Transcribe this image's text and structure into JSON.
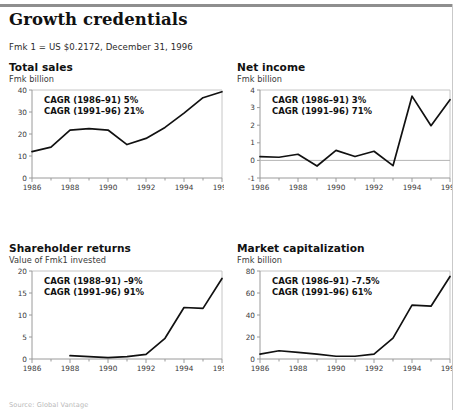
{
  "header": {
    "title": "Growth credentials",
    "subtitle": "Fmk 1 = US $0.2172, December 31, 1996"
  },
  "source_note": "Source: Global Vantage",
  "charts": [
    {
      "id": "total-sales",
      "title": "Total sales",
      "subtitle": "Fmk billion",
      "annotations": [
        "CAGR (1986–91) 5%",
        "CAGR (1991–96) 21%"
      ],
      "chart_data": {
        "type": "line",
        "title": "Total sales",
        "ylabel": "Fmk billion",
        "xlabel": "",
        "x": [
          1986,
          1987,
          1988,
          1989,
          1990,
          1991,
          1992,
          1993,
          1994,
          1995,
          1996
        ],
        "values": [
          12.0,
          14.0,
          21.8,
          22.4,
          21.8,
          15.2,
          18.0,
          23.0,
          29.5,
          36.5,
          39.2
        ],
        "xlim": [
          1986,
          1996
        ],
        "ylim": [
          0,
          40
        ],
        "yticks": [
          0,
          10,
          20,
          30,
          40
        ],
        "ytick_labels": [
          "0",
          "10",
          "20",
          "30",
          "40"
        ],
        "xticks": [
          1986,
          1988,
          1990,
          1992,
          1994,
          1996
        ],
        "xtick_labels": [
          "1986",
          "1988",
          "1990",
          "1992",
          "1994",
          "1996"
        ],
        "grid": false,
        "zero_line": false,
        "legend": "none"
      }
    },
    {
      "id": "net-income",
      "title": "Net income",
      "subtitle": "Fmk billion",
      "annotations": [
        "CAGR (1986–91) 3%",
        "CAGR (1991–96) 71%"
      ],
      "chart_data": {
        "type": "line",
        "title": "Net income",
        "ylabel": "Fmk billion",
        "xlabel": "",
        "x": [
          1986,
          1987,
          1988,
          1989,
          1990,
          1991,
          1992,
          1993,
          1994,
          1995,
          1996
        ],
        "values": [
          0.22,
          0.18,
          0.35,
          -0.32,
          0.57,
          0.22,
          0.52,
          -0.3,
          3.65,
          1.97,
          3.45
        ],
        "xlim": [
          1986,
          1996
        ],
        "ylim": [
          -1,
          4
        ],
        "yticks": [
          -1,
          0,
          1,
          2,
          3,
          4
        ],
        "ytick_labels": [
          "-1",
          "0",
          "1",
          "2",
          "3",
          "4"
        ],
        "xticks": [
          1986,
          1988,
          1990,
          1992,
          1994,
          1996
        ],
        "xtick_labels": [
          "1986",
          "1988",
          "1990",
          "1992",
          "1994",
          "1996"
        ],
        "grid": false,
        "zero_line": true,
        "legend": "none"
      }
    },
    {
      "id": "shareholder-returns",
      "title": "Shareholder returns",
      "subtitle": "Value of Fmk1 invested",
      "annotations": [
        "CAGR (1988–91) –9%",
        "CAGR (1991–96) 91%"
      ],
      "chart_data": {
        "type": "line",
        "title": "Shareholder returns",
        "ylabel": "Value of Fmk1 invested",
        "xlabel": "",
        "x": [
          1988,
          1989,
          1990,
          1991,
          1992,
          1993,
          1994,
          1995,
          1996
        ],
        "values": [
          0.75,
          0.55,
          0.3,
          0.55,
          1.05,
          4.7,
          11.7,
          11.5,
          18.3
        ],
        "xlim": [
          1986,
          1996
        ],
        "ylim": [
          0,
          20
        ],
        "yticks": [
          0,
          5,
          10,
          15,
          20
        ],
        "ytick_labels": [
          "0",
          "5",
          "10",
          "15",
          "20"
        ],
        "xticks": [
          1986,
          1988,
          1990,
          1992,
          1994,
          1996
        ],
        "xtick_labels": [
          "1986",
          "1988",
          "1990",
          "1992",
          "1994",
          "1996"
        ],
        "grid": false,
        "zero_line": false,
        "legend": "none"
      }
    },
    {
      "id": "market-capitalization",
      "title": "Market capitalization",
      "subtitle": "Fmk billion",
      "annotations": [
        "CAGR (1986–91) –7.5%",
        "CAGR (1991–96) 61%"
      ],
      "chart_data": {
        "type": "line",
        "title": "Market capitalization",
        "ylabel": "Fmk billion",
        "xlabel": "",
        "x": [
          1986,
          1987,
          1988,
          1989,
          1990,
          1991,
          1992,
          1993,
          1994,
          1995,
          1996
        ],
        "values": [
          4.5,
          7.5,
          6.0,
          4.5,
          2.5,
          2.5,
          4.5,
          19.0,
          49.0,
          48.0,
          75.0
        ],
        "xlim": [
          1986,
          1996
        ],
        "ylim": [
          0,
          80
        ],
        "yticks": [
          0,
          20,
          40,
          60,
          80
        ],
        "ytick_labels": [
          "0",
          "20",
          "40",
          "60",
          "80"
        ],
        "xticks": [
          1986,
          1988,
          1990,
          1992,
          1994,
          1996
        ],
        "xtick_labels": [
          "1986",
          "1988",
          "1990",
          "1992",
          "1994",
          "1996"
        ],
        "grid": false,
        "zero_line": false,
        "legend": "none"
      }
    }
  ]
}
